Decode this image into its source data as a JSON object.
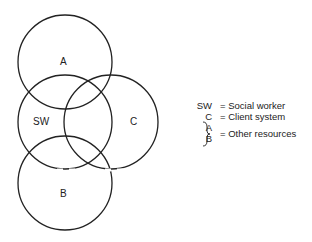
{
  "diagram": {
    "circles": [
      {
        "id": "A",
        "label": "A",
        "cx": 65,
        "cy": 62,
        "r": 47
      },
      {
        "id": "SW",
        "label": "SW",
        "cx": 65,
        "cy": 122,
        "r": 47
      },
      {
        "id": "C",
        "label": "C",
        "cx": 111,
        "cy": 122,
        "r": 47
      },
      {
        "id": "B",
        "label": "B",
        "cx": 65,
        "cy": 183,
        "r": 47
      }
    ],
    "stroke_color": "#222222"
  },
  "legend": {
    "items": [
      {
        "key": "SW",
        "value": "= Social worker"
      },
      {
        "key": "C",
        "value": "= Client system"
      },
      {
        "key": "A",
        "value": ""
      },
      {
        "key": "B",
        "value": ""
      }
    ],
    "group_label": "= Other resources"
  }
}
